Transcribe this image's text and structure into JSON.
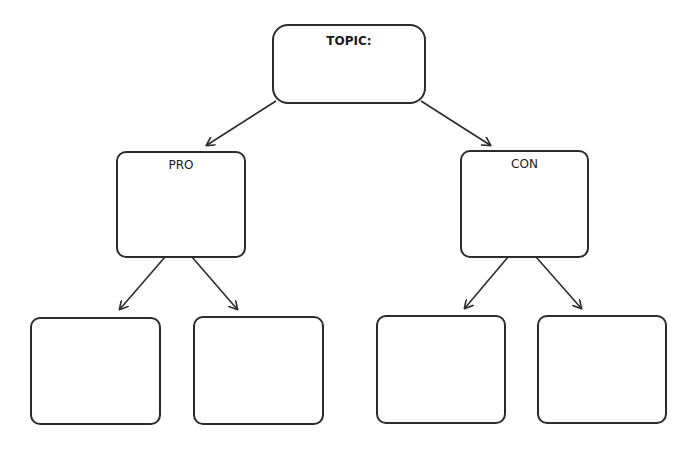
{
  "diagram": {
    "topic": {
      "label": "TOPIC:"
    },
    "pro": {
      "label": "PRO"
    },
    "con": {
      "label": "CON"
    },
    "pro_children": [
      {
        "label": ""
      },
      {
        "label": ""
      }
    ],
    "con_children": [
      {
        "label": ""
      },
      {
        "label": ""
      }
    ],
    "colors": {
      "stroke": "#2b2b2b",
      "background": "#ffffff",
      "text": "#1a1a1a"
    }
  }
}
